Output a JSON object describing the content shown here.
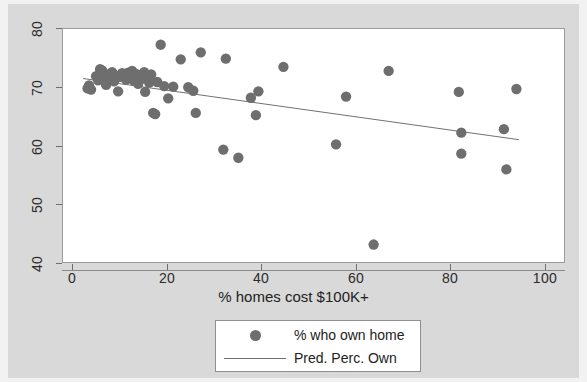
{
  "chart_data": {
    "type": "scatter",
    "title": "",
    "xlabel": "% homes cost $100K+",
    "ylabel": "",
    "xlim": [
      0,
      100
    ],
    "ylim": [
      40,
      80
    ],
    "xticks": [
      0,
      20,
      40,
      60,
      80,
      100
    ],
    "yticks": [
      40,
      50,
      60,
      70,
      80
    ],
    "grid": false,
    "legend_position": "below-axes",
    "marker_color": "#6e6e6e",
    "line_color": "#707070",
    "series": [
      {
        "name": "% who own home",
        "type": "scatter",
        "points": [
          [
            4.9,
            69.8
          ],
          [
            5.2,
            70.3
          ],
          [
            5.6,
            69.6
          ],
          [
            6.6,
            71.9
          ],
          [
            7.0,
            71.2
          ],
          [
            7.4,
            73.1
          ],
          [
            7.8,
            72.9
          ],
          [
            8.2,
            71.6
          ],
          [
            8.6,
            70.4
          ],
          [
            9.0,
            72.2
          ],
          [
            9.4,
            71.4
          ],
          [
            9.8,
            72.6
          ],
          [
            10.2,
            71.0
          ],
          [
            10.6,
            72.0
          ],
          [
            11.0,
            69.3
          ],
          [
            11.4,
            71.8
          ],
          [
            11.8,
            72.4
          ],
          [
            12.2,
            72.1
          ],
          [
            12.6,
            71.3
          ],
          [
            13.0,
            72.5
          ],
          [
            13.4,
            71.7
          ],
          [
            13.8,
            72.8
          ],
          [
            14.2,
            71.1
          ],
          [
            14.6,
            72.3
          ],
          [
            15.0,
            70.6
          ],
          [
            15.4,
            72.0
          ],
          [
            15.8,
            71.5
          ],
          [
            16.2,
            72.6
          ],
          [
            16.4,
            69.2
          ],
          [
            16.8,
            71.9
          ],
          [
            17.2,
            70.8
          ],
          [
            17.6,
            72.2
          ],
          [
            18.0,
            65.6
          ],
          [
            18.4,
            65.4
          ],
          [
            18.8,
            70.9
          ],
          [
            19.5,
            77.3
          ],
          [
            20.2,
            70.2
          ],
          [
            21.0,
            68.1
          ],
          [
            22.0,
            70.1
          ],
          [
            23.5,
            74.8
          ],
          [
            25.0,
            70.0
          ],
          [
            26.0,
            69.4
          ],
          [
            26.5,
            65.6
          ],
          [
            27.5,
            76.0
          ],
          [
            32.0,
            59.3
          ],
          [
            32.5,
            74.9
          ],
          [
            35.0,
            57.9
          ],
          [
            37.5,
            68.2
          ],
          [
            38.5,
            65.2
          ],
          [
            39.0,
            69.3
          ],
          [
            44.0,
            73.5
          ],
          [
            54.5,
            60.2
          ],
          [
            56.5,
            68.4
          ],
          [
            62.0,
            43.0
          ],
          [
            65.0,
            72.8
          ],
          [
            79.0,
            69.2
          ],
          [
            79.5,
            58.6
          ],
          [
            79.5,
            62.2
          ],
          [
            88.0,
            62.8
          ],
          [
            88.5,
            55.9
          ],
          [
            90.5,
            69.7
          ]
        ]
      },
      {
        "name": "Pred. Perc. Own",
        "type": "line",
        "points": [
          [
            4.0,
            71.5
          ],
          [
            91.0,
            61.0
          ]
        ]
      }
    ]
  },
  "axes": {
    "x_title": "% homes cost $100K+",
    "x_tick_labels": [
      "0",
      "20",
      "40",
      "60",
      "80",
      "100"
    ],
    "y_tick_labels": [
      "40",
      "50",
      "60",
      "70",
      "80"
    ]
  },
  "legend": {
    "entries": [
      {
        "label": "% who own home",
        "key": "dot"
      },
      {
        "label": "Pred. Perc. Own",
        "key": "line"
      }
    ]
  }
}
